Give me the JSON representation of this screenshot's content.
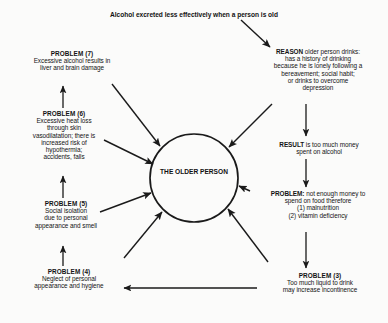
{
  "diagram": {
    "title": "Alcohol excreted less effectively when a person is old",
    "center": {
      "line1": "THE OLDER",
      "line2": "PERSON"
    },
    "colors": {
      "background": "#fbfbfa",
      "ink": "#111111",
      "stroke": "#1a1a1a"
    },
    "nodes": [
      {
        "id": "problem-7",
        "header": "PROBLEM (7)",
        "lines": [
          "Excessive alcohol results in",
          "liver and brain damage"
        ]
      },
      {
        "id": "problem-6",
        "header": "PROBLEM (6)",
        "lines": [
          "Excessive heat loss",
          "through skin",
          "vasodilatation; there is",
          "increased risk of",
          "hypothermia;",
          "accidents, falls"
        ]
      },
      {
        "id": "problem-5",
        "header": "PROBLEM (5)",
        "lines": [
          "Social isolation",
          "due to personal",
          "appearance and smell"
        ]
      },
      {
        "id": "problem-4",
        "header": "PROBLEM (4)",
        "lines": [
          "Neglect of personal",
          "appearance and hygiene"
        ]
      },
      {
        "id": "reason",
        "header": "REASON",
        "header_inline_text": " older person drinks:",
        "lines": [
          "has a history of drinking",
          "because he is lonely following a",
          "bereavement; social habit;",
          "or drinks to overcome",
          "depression"
        ]
      },
      {
        "id": "result",
        "header": "RESULT",
        "header_inline_text": " is too much money",
        "lines": [
          "spent on alcohol"
        ]
      },
      {
        "id": "problem-money",
        "header": "PROBLEM:",
        "header_inline_text": " not enough money to",
        "lines": [
          "spend on food therefore",
          "(1)  malnutrition",
          "(2)  vitamin deficiency"
        ]
      },
      {
        "id": "problem-3",
        "header": "PROBLEM (3)",
        "lines": [
          "Too much liquid to drink",
          "may increase incontinence"
        ]
      }
    ]
  }
}
